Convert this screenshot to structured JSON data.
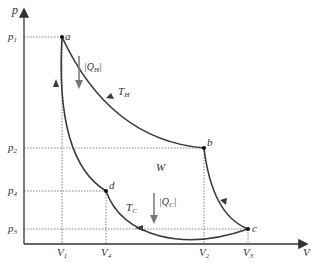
{
  "diagram": {
    "type": "pV carnot cycle",
    "axes": {
      "y_label": "p",
      "x_label": "V",
      "pressure_ticks": [
        {
          "label": "p",
          "sub": "1",
          "y": 37
        },
        {
          "label": "p",
          "sub": "2",
          "y": 148
        },
        {
          "label": "p",
          "sub": "4",
          "y": 191
        },
        {
          "label": "p",
          "sub": "3",
          "y": 229
        }
      ],
      "volume_ticks": [
        {
          "label": "V",
          "sub": "1",
          "x": 62
        },
        {
          "label": "V",
          "sub": "4",
          "x": 106
        },
        {
          "label": "V",
          "sub": "2",
          "x": 204
        },
        {
          "label": "V",
          "sub": "3",
          "x": 248
        }
      ]
    },
    "points": {
      "a": "a",
      "b": "b",
      "c": "c",
      "d": "d"
    },
    "labels": {
      "hot_isotherm": "T",
      "hot_sub": "H",
      "cold_isotherm": "T",
      "cold_sub": "C",
      "work": "W",
      "heat_in": "|Q",
      "heat_in_sub": "H",
      "heat_out": "|Q",
      "heat_out_sub": "C",
      "bar": "|"
    },
    "colors": {
      "curve": "#3a3a3a",
      "axis": "#333333",
      "heat_arrow": "#777777",
      "guide": "#666666"
    }
  }
}
